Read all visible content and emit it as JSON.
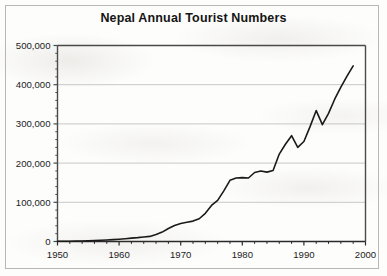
{
  "chart_data": {
    "type": "line",
    "title": "Nepal Annual Tourist Numbers",
    "xlabel": "",
    "ylabel": "",
    "xlim": [
      1950,
      2000
    ],
    "ylim": [
      0,
      500000
    ],
    "grid": "horizontal",
    "legend": "none",
    "x_tick_labels": [
      "1950",
      "1960",
      "1970",
      "1980",
      "1990",
      "2000"
    ],
    "x_ticks": [
      1950,
      1960,
      1970,
      1980,
      1990,
      2000
    ],
    "x_minor_tick_interval": 2,
    "y_tick_labels": [
      "0",
      "100,000",
      "200,000",
      "300,000",
      "400,000",
      "500,000"
    ],
    "y_ticks": [
      0,
      100000,
      200000,
      300000,
      400000,
      500000
    ],
    "line_color": "#1a1a1a",
    "gridline_color": "#c8c8c8",
    "axis_color": "#4a4a4a",
    "series": [
      {
        "name": "Annual tourist arrivals",
        "x": [
          1950,
          1951,
          1952,
          1953,
          1954,
          1955,
          1956,
          1957,
          1958,
          1959,
          1960,
          1961,
          1962,
          1963,
          1964,
          1965,
          1966,
          1967,
          1968,
          1969,
          1970,
          1971,
          1972,
          1973,
          1974,
          1975,
          1976,
          1977,
          1978,
          1979,
          1980,
          1981,
          1982,
          1983,
          1984,
          1985,
          1986,
          1987,
          1988,
          1989,
          1990,
          1991,
          1992,
          1993,
          1994,
          1995,
          1996,
          1997,
          1998
        ],
        "values": [
          500,
          600,
          800,
          1000,
          1300,
          1700,
          2300,
          3000,
          3800,
          4700,
          5800,
          7000,
          8500,
          9800,
          11500,
          13000,
          18000,
          24000,
          33000,
          41000,
          46000,
          49000,
          52000,
          58000,
          72000,
          92000,
          105000,
          129000,
          156000,
          162000,
          163000,
          162000,
          176000,
          180000,
          177000,
          181000,
          223000,
          248000,
          270000,
          240000,
          255000,
          293000,
          334000,
          298000,
          327000,
          363000,
          394000,
          422000,
          448000
        ]
      }
    ]
  }
}
